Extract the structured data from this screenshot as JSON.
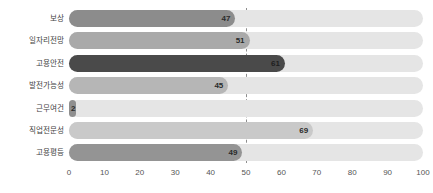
{
  "chart_data": {
    "type": "bar",
    "orientation": "horizontal",
    "title": "",
    "subtitle": "",
    "xlabel": "",
    "ylabel": "",
    "xlim": [
      0,
      100
    ],
    "xticks": [
      0,
      10,
      20,
      30,
      40,
      50,
      60,
      70,
      80,
      90,
      100
    ],
    "xtick_labels": [
      "0",
      "10",
      "20",
      "30",
      "40",
      "50",
      "60",
      "70",
      "80",
      "90",
      "100"
    ],
    "grid": false,
    "legend": null,
    "reference_line": {
      "value": 50,
      "label": "50",
      "style": "dashed",
      "color": "#8d8d8d"
    },
    "track_color": "#e5e5e5",
    "categories": [
      "보상",
      "일자리전망",
      "고용안전",
      "발전가능성",
      "근무여건",
      "직업전문성",
      "고용평등"
    ],
    "values": [
      47,
      51,
      61,
      45,
      2,
      69,
      49
    ],
    "value_labels": [
      "47",
      "51",
      "61",
      "45",
      "2",
      "69",
      "49"
    ],
    "bar_colors": [
      "#8c8c8c",
      "#a9a9a9",
      "#4a4a4a",
      "#b6b6b6",
      "#8f8f8f",
      "#c9c9c9",
      "#949494"
    ],
    "bars": [
      {
        "category": "보상",
        "value": 47,
        "label": "47",
        "color": "#8c8c8c",
        "dark": false
      },
      {
        "category": "일자리전망",
        "value": 51,
        "label": "51",
        "color": "#a9a9a9",
        "dark": false
      },
      {
        "category": "고용안전",
        "value": 61,
        "label": "61",
        "color": "#4a4a4a",
        "dark": true
      },
      {
        "category": "발전가능성",
        "value": 45,
        "label": "45",
        "color": "#b6b6b6",
        "dark": false
      },
      {
        "category": "근무여건",
        "value": 2,
        "label": "2",
        "color": "#8f8f8f",
        "dark": false
      },
      {
        "category": "직업전문성",
        "value": 69,
        "label": "69",
        "color": "#c9c9c9",
        "dark": false
      },
      {
        "category": "고용평등",
        "value": 49,
        "label": "49",
        "color": "#949494",
        "dark": false
      }
    ]
  }
}
